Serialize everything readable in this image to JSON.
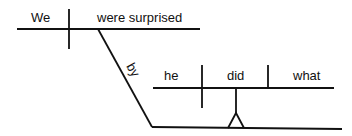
{
  "diagram": {
    "type": "sentence-diagram",
    "main_clause": {
      "subject": "We",
      "verb": "were surprised"
    },
    "preposition": "by",
    "object_clause": {
      "subject": "he",
      "verb": "did",
      "object": "what"
    },
    "line_color": "#111111"
  }
}
